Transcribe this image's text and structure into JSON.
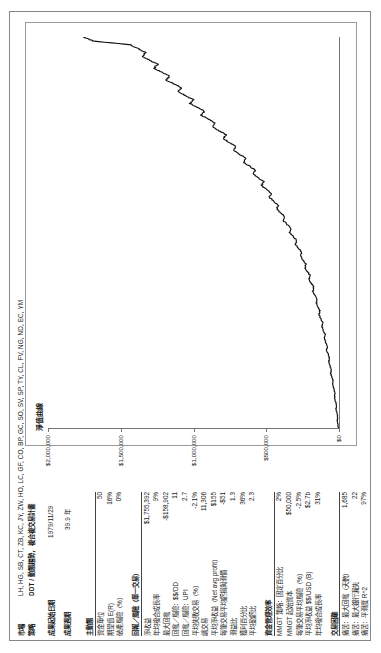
{
  "report": {
    "market_label": "市場",
    "market_value": "LH, HG, SB, CT, ZB, KC, JY, ZW, HO, LC, GF, CO, BP, GC, SO, SV, SP, TY, CL, FV, NG, ND, EC, YM",
    "strategy_label": "策略",
    "strategy_value": "DDT / 動態趨勢，複合複交易計畫",
    "start_date_label": "成果起始日期",
    "start_date_value": "1979/11/29",
    "period_label": "成果週期",
    "period_value": "39.9 年"
  },
  "sections": [
    {
      "title": "主動態",
      "rows": [
        {
          "label": "資金單位",
          "value": "50"
        },
        {
          "label": "期望值 E(R)",
          "value": "16%"
        },
        {
          "label": "破產風險（%）",
          "value": "0%"
        }
      ]
    },
    {
      "title": "回報／風險（單一交易）",
      "rows": [
        {
          "label": "淨收益",
          "value": "$1,755,392"
        },
        {
          "label": "年均複合成長率",
          "value": "9%"
        },
        {
          "label": "最大回撤",
          "value": "-$158,902"
        },
        {
          "label": "回撤／風險：$$/DD",
          "value": "11"
        },
        {
          "label": "回撤／風險：UPI",
          "value": "2.7"
        },
        {
          "label": "平均失敗交易（%）",
          "value": "-2.1%"
        },
        {
          "label": "總交易",
          "value": "11,306"
        },
        {
          "label": "平均淨收益（Net avg profit）",
          "value": "$155"
        },
        {
          "label": "每筆交易平均虧損與滑價",
          "value": "-$51"
        },
        {
          "label": "滑益比",
          "value": "1.3"
        },
        {
          "label": "獲利百分比",
          "value": "36%"
        },
        {
          "label": "平均盈虧比",
          "value": "2.3"
        }
      ]
    },
    {
      "title": "資金管理效率",
      "rows": [
        {
          "label": "MMGT 策略：固定百分比",
          "value": "2%"
        },
        {
          "label": "MMGT 起始資本",
          "value": "$50,000"
        },
        {
          "label": "每筆交易平均風險（%）",
          "value": "-2.5%"
        },
        {
          "label": "平均淨收益 $$/USD (B)",
          "value": "$2.7b"
        },
        {
          "label": "年均複合成長率",
          "value": "31%"
        }
      ]
    },
    {
      "title": "交易困難",
      "rows": [
        {
          "label": "痛苦：最大回撤（天數）",
          "value": "1,685"
        },
        {
          "label": "痛苦：最大銀行漏失",
          "value": "22"
        },
        {
          "label": "痛苦：平滑度 R^2",
          "value": "97%"
        }
      ]
    }
  ],
  "chart_data": {
    "type": "line",
    "title": "淨值曲線",
    "xlabel": "",
    "ylabel": "",
    "ylim": [
      0,
      2000000
    ],
    "yticks": [
      0,
      500000,
      1000000,
      1500000,
      2000000
    ],
    "ytick_labels": [
      "$0",
      "$500,000",
      "$1,000,000",
      "$1,500,000",
      "$2,000,000"
    ],
    "grid": false,
    "legend": "none",
    "series": [
      {
        "name": "Equity",
        "x": [
          0,
          1,
          2,
          3,
          4,
          5,
          6,
          7,
          8,
          9,
          10,
          11,
          12,
          13,
          14,
          15,
          16,
          17,
          18,
          19,
          20,
          21,
          22,
          23,
          24,
          25,
          26,
          27,
          28,
          29,
          30,
          31,
          32,
          33,
          34,
          35,
          36,
          37,
          38,
          39,
          40,
          41,
          42,
          43,
          44,
          45,
          46,
          47,
          48,
          49,
          50,
          51,
          52,
          53,
          54,
          55,
          56,
          57,
          58,
          59,
          60,
          61,
          62,
          63,
          64,
          65,
          66,
          67,
          68,
          69,
          70,
          71,
          72,
          73,
          74,
          75,
          76,
          77,
          78,
          79,
          80,
          81,
          82,
          83,
          84,
          85,
          86,
          87,
          88,
          89,
          90,
          91,
          92,
          93,
          94,
          95,
          96,
          97,
          98,
          99,
          100
        ],
        "values": [
          4000,
          7000,
          12000,
          9000,
          15000,
          21000,
          17000,
          26000,
          31000,
          28000,
          36000,
          44000,
          40000,
          49000,
          57000,
          53000,
          62000,
          70000,
          66000,
          76000,
          85000,
          80000,
          92000,
          101000,
          96000,
          108000,
          118000,
          113000,
          126000,
          137000,
          131000,
          145000,
          157000,
          151000,
          166000,
          180000,
          173000,
          190000,
          205000,
          198000,
          217000,
          234000,
          227000,
          248000,
          266000,
          258000,
          280000,
          300000,
          291000,
          315000,
          338000,
          329000,
          356000,
          381000,
          371000,
          400000,
          428000,
          417000,
          449000,
          479000,
          466000,
          500000,
          533000,
          519000,
          556000,
          592000,
          577000,
          617000,
          657000,
          640000,
          682000,
          725000,
          707000,
          751000,
          796000,
          777000,
          823000,
          870000,
          850000,
          898000,
          947000,
          926000,
          975000,
          1025000,
          1003000,
          1054000,
          1106000,
          1083000,
          1135000,
          1188000,
          1164000,
          1217000,
          1270000,
          1246000,
          1299000,
          1352000,
          1328000,
          1380000,
          1432000,
          1690000,
          1755392
        ]
      }
    ]
  }
}
